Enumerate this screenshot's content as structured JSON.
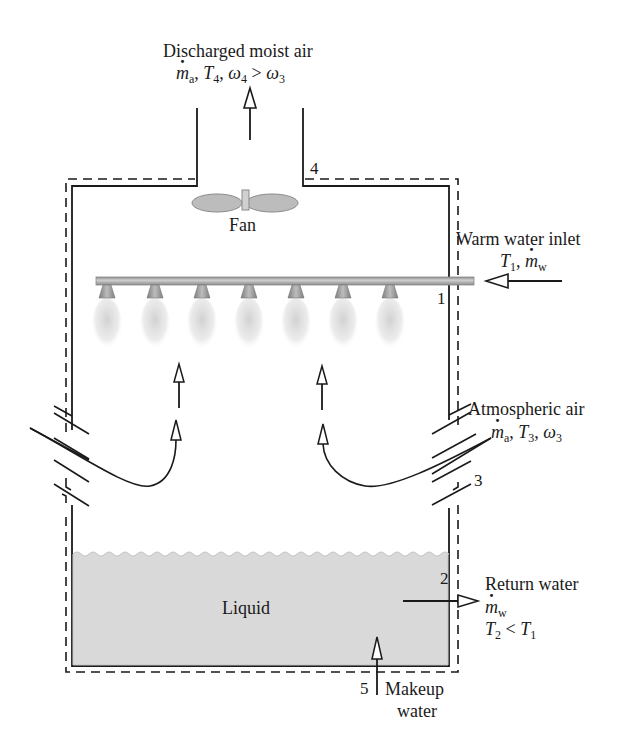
{
  "labels": {
    "discharged": {
      "title": "Discharged moist air",
      "mdot_sym": "m",
      "mdot_sub": "a",
      "sep1": ", ",
      "T_sym": "T",
      "T_sub": "4",
      "sep2": ", ",
      "w_sym": "ω",
      "w_sub": "4",
      "rel": " > ",
      "w3_sym": "ω",
      "w3_sub": "3"
    },
    "fan": "Fan",
    "warm_inlet": {
      "title": "Warm water inlet",
      "T_sym": "T",
      "T_sub": "1",
      "sep": ", ",
      "mdot_sym": "m",
      "mdot_sub": "w"
    },
    "atmospheric": {
      "title": "Atmospheric air",
      "mdot_sym": "m",
      "mdot_sub": "a",
      "sep1": ", ",
      "T_sym": "T",
      "T_sub": "3",
      "sep2": ", ",
      "w_sym": "ω",
      "w_sub": "3"
    },
    "return_water": {
      "title": "Return water",
      "mdot_sym": "m",
      "mdot_sub": "w",
      "T2_sym": "T",
      "T2_sub": "2",
      "rel": " < ",
      "T1_sym": "T",
      "T1_sub": "1"
    },
    "liquid": "Liquid",
    "makeup": {
      "line1": "Makeup",
      "line2": "water"
    },
    "states": {
      "s1": "1",
      "s2": "2",
      "s3": "3",
      "s4": "4",
      "s5": "5"
    }
  },
  "colors": {
    "line": "#1a1a1a",
    "liquid": "#d9d9d9",
    "pipe": "#b8b8b8",
    "nozzle": "#9a9a9a",
    "spray": "#dcdcdc",
    "fan": "#b5b5b5"
  },
  "nozzles": {
    "count": 7,
    "x_positions": [
      107,
      155,
      202,
      249,
      296,
      343,
      390
    ]
  }
}
